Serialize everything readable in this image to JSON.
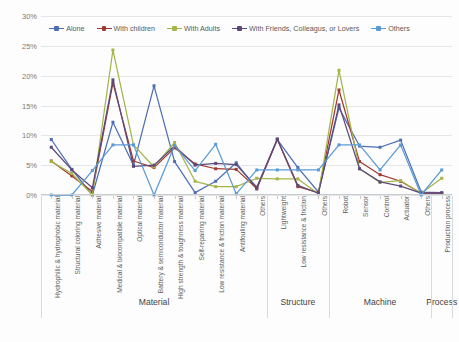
{
  "chart_data": {
    "type": "line",
    "title": "",
    "xlabel": "",
    "ylabel": "",
    "ylim": [
      0,
      30
    ],
    "ytick_labels": [
      "0%",
      "5%",
      "10%",
      "15%",
      "20%",
      "25%",
      "30%"
    ],
    "yticks": [
      0,
      5,
      10,
      15,
      20,
      25,
      30
    ],
    "grid": true,
    "legend_position": "top-center",
    "categories": [
      "Hydrophilic & hydrophobic material",
      "Structural coloring material",
      "Adhesive material",
      "Medical & biocompatible material",
      "Optical material",
      "Battery & semiconductor material",
      "High strength & toughness material",
      "Self-repairing material",
      "Low resistance & friction material",
      "Antifouling material",
      "Others",
      "Lightweight",
      "Low resistance & friction",
      "Others",
      "Robot",
      "Sensor",
      "Control",
      "Actuator",
      "Others",
      "Production process"
    ],
    "groups": [
      {
        "label": "Material",
        "start": 0,
        "end": 10
      },
      {
        "label": "Structure",
        "start": 11,
        "end": 13
      },
      {
        "label": "Machine",
        "start": 14,
        "end": 18
      },
      {
        "label": "Process",
        "start": 19,
        "end": 19
      }
    ],
    "series": [
      {
        "name": "Alone",
        "color": "#4f6fb5",
        "values": [
          9.3,
          4.3,
          0.0,
          12.2,
          5.0,
          18.3,
          5.6,
          0.4,
          2.3,
          5.4,
          1.0,
          9.3,
          4.6,
          0.5,
          14.6,
          8.2,
          8.0,
          9.2,
          0.5,
          0.4
        ]
      },
      {
        "name": "With children",
        "color": "#9e3a32",
        "values": [
          5.7,
          3.2,
          0.6,
          18.8,
          5.7,
          4.6,
          7.9,
          5.2,
          4.4,
          4.3,
          1.1,
          9.3,
          1.4,
          0.4,
          17.6,
          5.6,
          3.4,
          2.3,
          0.3,
          0.3
        ]
      },
      {
        "name": "With Adults",
        "color": "#a5b54a",
        "values": [
          5.6,
          3.6,
          0.0,
          24.3,
          8.4,
          4.7,
          8.8,
          2.3,
          1.4,
          1.4,
          2.8,
          2.7,
          2.7,
          0.2,
          20.9,
          4.4,
          2.1,
          2.4,
          0.3,
          2.8
        ]
      },
      {
        "name": "With Friends, Colleagus, or Lovers",
        "color": "#5c4a7d",
        "values": [
          8.0,
          4.2,
          1.2,
          19.3,
          4.8,
          5.0,
          8.2,
          5.0,
          5.3,
          5.1,
          1.3,
          9.4,
          1.6,
          0.3,
          15.1,
          4.4,
          2.2,
          1.5,
          0.3,
          0.3
        ]
      },
      {
        "name": "Others",
        "color": "#5b9bd5",
        "values": [
          0.0,
          0.0,
          4.1,
          8.4,
          8.4,
          0.0,
          8.3,
          4.1,
          8.5,
          0.2,
          4.2,
          4.2,
          4.2,
          4.2,
          8.4,
          8.4,
          4.2,
          8.4,
          0.0,
          4.2
        ]
      }
    ]
  }
}
